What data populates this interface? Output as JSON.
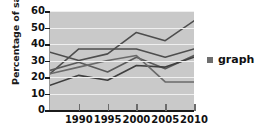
{
  "chart_data": {
    "type": "line",
    "title": "",
    "xlabel": "",
    "ylabel": "Percentage of sales",
    "x": [
      1985,
      1990,
      1995,
      2000,
      2005,
      2010
    ],
    "xtick_labels": [
      "1990",
      "1995",
      "2000",
      "2005",
      "2010"
    ],
    "xtick_values": [
      1990,
      1995,
      2000,
      2005,
      2010
    ],
    "xlim": [
      1985,
      2010
    ],
    "ylim": [
      0,
      60
    ],
    "ytick_labels": [
      "0",
      "10",
      "20",
      "30",
      "40",
      "50",
      "60"
    ],
    "ytick_values": [
      0,
      10,
      20,
      30,
      40,
      50,
      60
    ],
    "grid": true,
    "grid_color": "#efefef",
    "plot_background": "#c9c9c9",
    "legend_position": "right",
    "legend_entries": [
      "graph"
    ],
    "series": [
      {
        "name": "series-1",
        "color": "#4d4d4d",
        "values": [
          35,
          30,
          34,
          47,
          42,
          54
        ]
      },
      {
        "name": "series-2",
        "color": "#4d4d4d",
        "values": [
          22,
          37,
          37,
          37,
          32,
          37
        ]
      },
      {
        "name": "series-3",
        "color": "#5a5a5a",
        "values": [
          24,
          29,
          23,
          32,
          25,
          33
        ]
      },
      {
        "name": "series-4",
        "color": "#3f3f3f",
        "values": [
          15,
          21,
          18,
          27,
          26,
          32
        ]
      },
      {
        "name": "series-5",
        "color": "#6a6a6a",
        "values": [
          22,
          26,
          30,
          33,
          17,
          17
        ]
      }
    ]
  },
  "axis": {
    "y_title": "Percentage of sales"
  },
  "legend": {
    "marker": "square-swatch",
    "label": "graph",
    "color": "#6e6e6e"
  }
}
